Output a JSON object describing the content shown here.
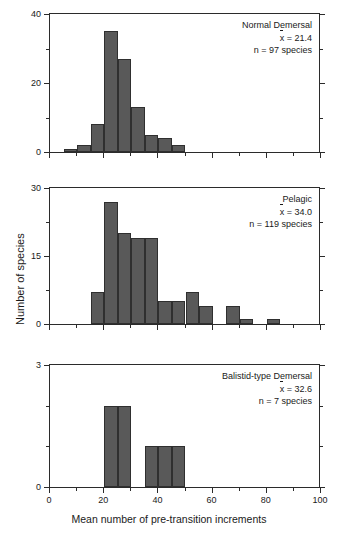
{
  "figure": {
    "xlabel": "Mean number of pre-transition increments",
    "ylabel": "Number of species"
  },
  "chart_data": {
    "type": "bar",
    "title": "",
    "xlabel": "Mean number of pre-transition increments",
    "ylabel": "Number of species",
    "xlim": [
      0,
      100
    ],
    "bin_width": 5,
    "xticks_major": [
      0,
      20,
      40,
      60,
      80,
      100
    ],
    "xticks_minor": [
      10,
      30,
      50,
      70,
      90
    ],
    "xticklabels": [
      "0",
      "20",
      "40",
      "60",
      "80",
      "100"
    ],
    "grid": false,
    "legend": "none",
    "panels": [
      {
        "name": "Normal Demersal",
        "mean_label": "x̅ = 21.4",
        "mean_value": 21.4,
        "n_label": "n = 97 species",
        "n_value": 97,
        "ylim": [
          0,
          40
        ],
        "yticks_major": [
          0,
          20,
          40
        ],
        "yticks_minor": [
          10,
          30
        ],
        "yticklabels": [
          "0",
          "20",
          "40"
        ],
        "bins": [
          {
            "x0": 5,
            "x1": 10,
            "value": 1
          },
          {
            "x0": 10,
            "x1": 15,
            "value": 2
          },
          {
            "x0": 15,
            "x1": 20,
            "value": 8
          },
          {
            "x0": 20,
            "x1": 25,
            "value": 35
          },
          {
            "x0": 25,
            "x1": 30,
            "value": 27
          },
          {
            "x0": 30,
            "x1": 35,
            "value": 13
          },
          {
            "x0": 35,
            "x1": 40,
            "value": 5
          },
          {
            "x0": 40,
            "x1": 45,
            "value": 4
          },
          {
            "x0": 45,
            "x1": 50,
            "value": 2
          }
        ]
      },
      {
        "name": "Pelagic",
        "mean_label": "x̅ = 34.0",
        "mean_value": 34.0,
        "n_label": "n = 119 species",
        "n_value": 119,
        "ylim": [
          0,
          30
        ],
        "yticks_major": [
          0,
          15,
          30
        ],
        "yticks_minor": [
          7.5,
          22.5
        ],
        "yticklabels": [
          "0",
          "15",
          "30"
        ],
        "bins": [
          {
            "x0": 15,
            "x1": 20,
            "value": 7
          },
          {
            "x0": 20,
            "x1": 25,
            "value": 27
          },
          {
            "x0": 25,
            "x1": 30,
            "value": 20
          },
          {
            "x0": 30,
            "x1": 35,
            "value": 19
          },
          {
            "x0": 35,
            "x1": 40,
            "value": 19
          },
          {
            "x0": 40,
            "x1": 45,
            "value": 5
          },
          {
            "x0": 45,
            "x1": 50,
            "value": 5
          },
          {
            "x0": 50,
            "x1": 55,
            "value": 7
          },
          {
            "x0": 55,
            "x1": 60,
            "value": 4
          },
          {
            "x0": 65,
            "x1": 70,
            "value": 4
          },
          {
            "x0": 70,
            "x1": 75,
            "value": 1
          },
          {
            "x0": 80,
            "x1": 85,
            "value": 1
          }
        ]
      },
      {
        "name": "Balistid-type Demersal",
        "mean_label": "x̅ = 32.6",
        "mean_value": 32.6,
        "n_label": "n = 7 species",
        "n_value": 7,
        "ylim": [
          0,
          3
        ],
        "yticks_major": [
          0,
          3
        ],
        "yticks_minor": [
          1,
          2
        ],
        "yticklabels": [
          "0",
          "3"
        ],
        "bins": [
          {
            "x0": 20,
            "x1": 25,
            "value": 2
          },
          {
            "x0": 25,
            "x1": 30,
            "value": 2
          },
          {
            "x0": 35,
            "x1": 40,
            "value": 1
          },
          {
            "x0": 40,
            "x1": 45,
            "value": 1
          },
          {
            "x0": 45,
            "x1": 50,
            "value": 1
          }
        ]
      }
    ]
  },
  "colors": {
    "bar_fill": "#595959",
    "bar_edge": "#2f2f2f",
    "axis": "#2b2b2b",
    "text": "#1a1a1a",
    "background": "#ffffff"
  }
}
